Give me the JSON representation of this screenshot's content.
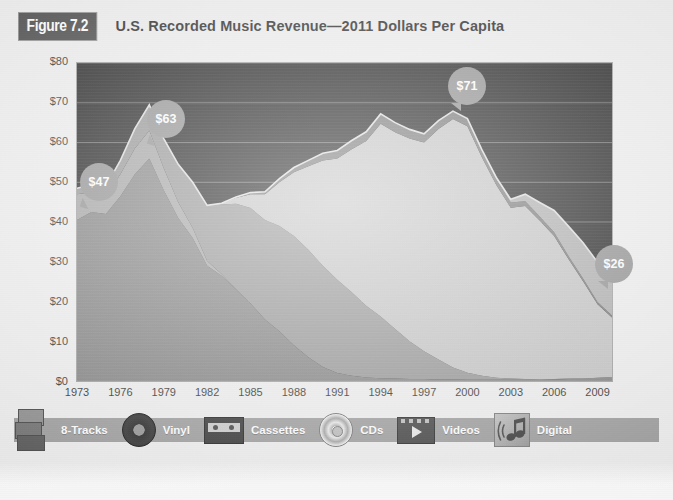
{
  "header": {
    "figure_badge": "Figure 7.2",
    "title": "U.S. Recorded Music Revenue—2011 Dollars Per Capita"
  },
  "axes": {
    "y_ticks": [
      "$80",
      "$70",
      "$60",
      "$50",
      "$40",
      "$30",
      "$20",
      "$10",
      "$0"
    ],
    "x_ticks": [
      "1973",
      "1976",
      "1979",
      "1982",
      "1985",
      "1988",
      "1991",
      "1994",
      "1997",
      "2000",
      "2003",
      "2006",
      "2009"
    ]
  },
  "callouts": [
    {
      "name": "callout-47",
      "label": "$47"
    },
    {
      "name": "callout-63",
      "label": "$63"
    },
    {
      "name": "callout-71",
      "label": "$71"
    },
    {
      "name": "callout-26",
      "label": "$26"
    }
  ],
  "legend": [
    {
      "label": "8-Tracks",
      "icon": "eight-track-cartridge-icon",
      "color": "#9d9d9d"
    },
    {
      "label": "Vinyl",
      "icon": "vinyl-record-icon",
      "color": "#7a7a7a"
    },
    {
      "label": "Cassettes",
      "icon": "cassette-tape-icon",
      "color": "#8e8e8e"
    },
    {
      "label": "CDs",
      "icon": "compact-disc-icon",
      "color": "#bfbfbf"
    },
    {
      "label": "Videos",
      "icon": "video-tape-icon",
      "color": "#6e6e6e"
    },
    {
      "label": "Digital",
      "icon": "digital-music-note-icon",
      "color": "#a8a8a8"
    }
  ],
  "colors": {
    "plot_background": "#141414",
    "gridline": "#5d5d5d",
    "page_background": "#eeeeee",
    "badge_background": "#3f3f3f",
    "callout_bubble": "#8a8a8a",
    "legend_bar": "#999999"
  },
  "chart_data": {
    "type": "area",
    "title": "U.S. Recorded Music Revenue—2011 Dollars Per Capita",
    "subtitle": "Figure 7.2",
    "xlabel": "",
    "ylabel": "2011 Dollars Per Capita",
    "stacked": true,
    "grid": true,
    "legend_position": "bottom",
    "xlim": [
      1973,
      2010
    ],
    "ylim": [
      0,
      80
    ],
    "y_tick_values": [
      0,
      10,
      20,
      30,
      40,
      50,
      60,
      70,
      80
    ],
    "x_tick_values": [
      1973,
      1976,
      1979,
      1982,
      1985,
      1988,
      1991,
      1994,
      1997,
      2000,
      2003,
      2006,
      2009
    ],
    "x": [
      1973,
      1974,
      1975,
      1976,
      1977,
      1978,
      1979,
      1980,
      1981,
      1982,
      1983,
      1984,
      1985,
      1986,
      1987,
      1988,
      1989,
      1990,
      1991,
      1992,
      1993,
      1994,
      1995,
      1996,
      1997,
      1998,
      1999,
      2000,
      2001,
      2002,
      2003,
      2004,
      2005,
      2006,
      2007,
      2008,
      2009,
      2010
    ],
    "series": [
      {
        "name": "Vinyl",
        "color": "#7a7a7a",
        "values": [
          40.5,
          42.5,
          42.0,
          46.5,
          52.0,
          56.0,
          48.0,
          41.0,
          36.0,
          29.0,
          26.5,
          23.0,
          19.5,
          15.5,
          12.5,
          9.0,
          6.0,
          3.5,
          2.0,
          1.3,
          0.9,
          0.7,
          0.6,
          0.5,
          0.5,
          0.4,
          0.4,
          0.3,
          0.3,
          0.3,
          0.3,
          0.3,
          0.3,
          0.4,
          0.5,
          0.6,
          0.8,
          1.0
        ]
      },
      {
        "name": "8-Tracks",
        "color": "#9d9d9d",
        "values": [
          6.5,
          5.0,
          4.5,
          5.5,
          6.5,
          7.0,
          5.5,
          4.0,
          2.5,
          1.2,
          0.4,
          0.1,
          0.0,
          0.0,
          0.0,
          0.0,
          0.0,
          0.0,
          0.0,
          0.0,
          0.0,
          0.0,
          0.0,
          0.0,
          0.0,
          0.0,
          0.0,
          0.0,
          0.0,
          0.0,
          0.0,
          0.0,
          0.0,
          0.0,
          0.0,
          0.0,
          0.0,
          0.0
        ]
      },
      {
        "name": "Cassettes",
        "color": "#8e8e8e",
        "values": [
          1.5,
          2.0,
          2.5,
          3.5,
          5.0,
          6.5,
          7.5,
          9.5,
          11.5,
          14.0,
          17.5,
          21.5,
          24.0,
          25.0,
          26.5,
          27.5,
          27.0,
          25.5,
          23.5,
          21.0,
          18.0,
          15.5,
          12.5,
          9.5,
          7.0,
          5.0,
          3.0,
          1.8,
          1.0,
          0.5,
          0.3,
          0.2,
          0.1,
          0.1,
          0.1,
          0.0,
          0.0,
          0.0
        ]
      },
      {
        "name": "CDs",
        "color": "#bfbfbf",
        "values": [
          0.0,
          0.0,
          0.0,
          0.0,
          0.0,
          0.0,
          0.0,
          0.0,
          0.0,
          0.0,
          0.3,
          1.5,
          3.5,
          6.5,
          11.0,
          16.0,
          21.0,
          26.5,
          30.5,
          36.0,
          41.5,
          48.5,
          49.5,
          51.0,
          52.5,
          58.0,
          62.5,
          62.0,
          55.0,
          48.5,
          43.0,
          43.5,
          40.0,
          36.0,
          30.0,
          24.5,
          18.5,
          15.0
        ]
      },
      {
        "name": "Videos",
        "color": "#6e6e6e",
        "values": [
          0.0,
          0.0,
          0.0,
          0.0,
          0.0,
          0.0,
          0.0,
          0.0,
          0.0,
          0.0,
          0.0,
          0.2,
          0.4,
          0.6,
          0.9,
          1.2,
          1.5,
          1.8,
          2.0,
          2.2,
          2.3,
          2.5,
          2.4,
          2.3,
          2.2,
          2.1,
          2.0,
          1.9,
          1.7,
          1.5,
          1.3,
          1.2,
          1.0,
          0.9,
          0.8,
          0.7,
          0.6,
          0.5
        ]
      },
      {
        "name": "Digital",
        "color": "#a8a8a8",
        "values": [
          0.0,
          0.0,
          0.0,
          0.0,
          0.0,
          0.0,
          0.0,
          0.0,
          0.0,
          0.0,
          0.0,
          0.0,
          0.0,
          0.0,
          0.0,
          0.0,
          0.0,
          0.0,
          0.0,
          0.0,
          0.0,
          0.0,
          0.0,
          0.0,
          0.0,
          0.0,
          0.0,
          0.0,
          0.2,
          0.4,
          0.8,
          1.8,
          3.5,
          5.5,
          7.5,
          9.0,
          10.0,
          10.5
        ]
      }
    ],
    "annotations": [
      {
        "label": "$47",
        "x": 1973,
        "y": 47
      },
      {
        "label": "$63",
        "x": 1978,
        "y": 63
      },
      {
        "label": "$71",
        "x": 1999,
        "y": 71
      },
      {
        "label": "$26",
        "x": 2009,
        "y": 26
      }
    ]
  }
}
